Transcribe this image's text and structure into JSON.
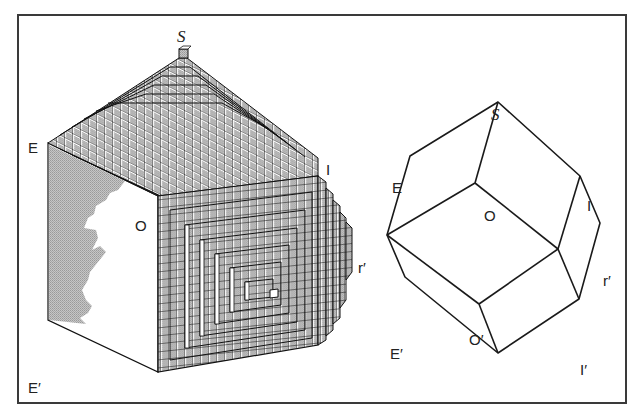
{
  "figure": {
    "left": {
      "title": "stepped cube crystal model",
      "labels": {
        "S": "S",
        "E": "E",
        "O": "O",
        "I": "I",
        "r_prime": "r′",
        "E_prime": "E′",
        "I_prime": "I′",
        "O_prime": "O′"
      }
    },
    "right": {
      "title": "polyhedron outline",
      "labels": {
        "S": "S",
        "E": "E",
        "O": "O",
        "I": "I",
        "r_prime": "r′",
        "E_prime": "E′",
        "O_prime": "O′",
        "I_prime": "I′"
      }
    },
    "colors": {
      "line": "#1a1a1a",
      "face_gray": "#b8b8b8",
      "frame": "#3a3a3a",
      "background": "#ffffff"
    }
  }
}
